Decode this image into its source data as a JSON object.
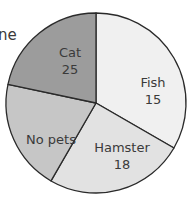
{
  "cut_off_text": "ne",
  "chart_data": {
    "type": "pie",
    "title": "",
    "slices": [
      {
        "label": "Cat",
        "value": 25,
        "value_label": "25",
        "color": "#f0f0f0",
        "start_deg": -90,
        "end_deg": 30,
        "label_x": 70,
        "label_y": 44
      },
      {
        "label": "Fish",
        "value": 15,
        "value_label": "15",
        "color": "#e2e2e2",
        "start_deg": 30,
        "end_deg": 120,
        "label_x": 153,
        "label_y": 74
      },
      {
        "label": "Hamster",
        "value": 18,
        "value_label": "18",
        "color": "#c6c6c6",
        "start_deg": 120,
        "end_deg": 192,
        "label_x": 122,
        "label_y": 139
      },
      {
        "label": "No pets",
        "value": null,
        "value_label": "",
        "color": "#9c9c9c",
        "start_deg": 192,
        "end_deg": 270,
        "label_x": 51,
        "label_y": 131
      }
    ],
    "center": [
      96,
      103
    ],
    "radius": 90,
    "stroke": "#2a2a2a"
  }
}
